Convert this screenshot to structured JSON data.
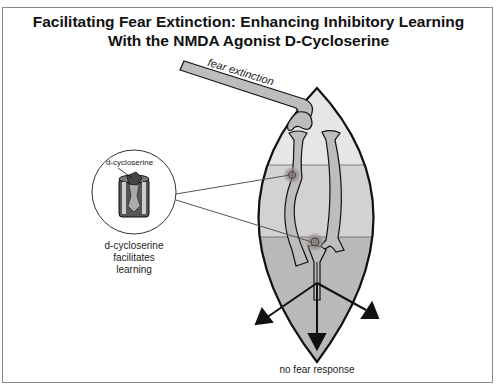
{
  "figure": {
    "title_line1": "Facilitating Fear Extinction: Enhancing Inhibitory Learning",
    "title_line2": "With the NMDA Agonist D-Cycloserine"
  },
  "labels": {
    "input_pathway": "fear extinction",
    "inset_drug": "d-cycloserine",
    "inset_caption_line1": "d-cycloserine",
    "inset_caption_line2": "facilitates",
    "inset_caption_line3": "learning",
    "output": "no fear response"
  },
  "colors": {
    "lens_top": "#e6e6e6",
    "lens_mid": "#d2d2d2",
    "lens_bottom": "#b9b9b9",
    "neuron_fill": "#bdbdbd",
    "synapse_glow": "#8c7f7f",
    "outline": "#111111",
    "frame_border": "#8a8a8a"
  }
}
